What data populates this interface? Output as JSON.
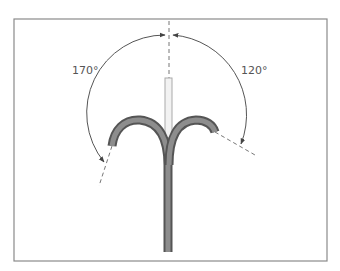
{
  "diagram": {
    "angles": {
      "left": {
        "label": "170°",
        "value": 170
      },
      "right": {
        "label": "120°",
        "value": 120
      }
    },
    "colors": {
      "frame": "#8a8a8a",
      "catheter": "#6e6e6e",
      "catheter_highlight": "#9a9a9a",
      "guide_rod": "#cfcfcf",
      "arc": "#555555",
      "dashed": "#777777",
      "text": "#555555"
    }
  }
}
